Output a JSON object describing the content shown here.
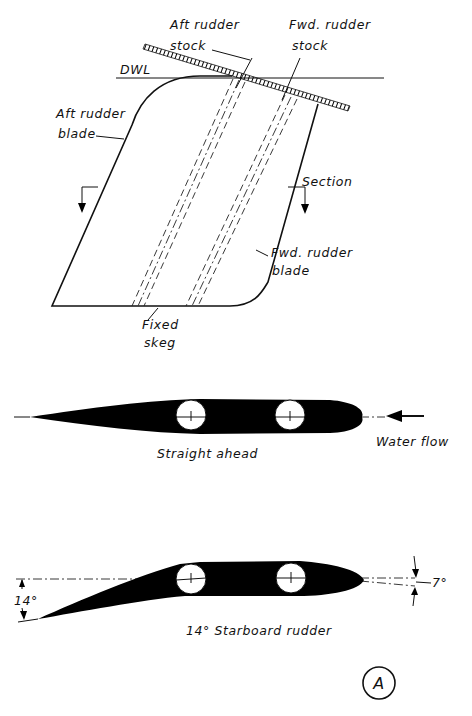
{
  "figure": {
    "label": "A",
    "top_view": {
      "labels": {
        "aft_stock_line1": "Aft rudder",
        "aft_stock_line2": "stock",
        "fwd_stock_line1": "Fwd. rudder",
        "fwd_stock_line2": "stock",
        "dwl": "DWL",
        "aft_blade_line1": "Aft rudder",
        "aft_blade_line2": "blade",
        "section": "Section",
        "fwd_blade_line1": "Fwd. rudder",
        "fwd_blade_line2": "blade",
        "skeg_line1": "Fixed",
        "skeg_line2": "skeg"
      }
    },
    "section_straight": {
      "caption": "Straight ahead",
      "flow_label": "Water flow"
    },
    "section_turned": {
      "caption": "14° Starboard rudder",
      "aft_angle_label": "14°",
      "fwd_angle_label": "7°",
      "aft_angle_deg": 14,
      "fwd_angle_deg": 7
    }
  }
}
